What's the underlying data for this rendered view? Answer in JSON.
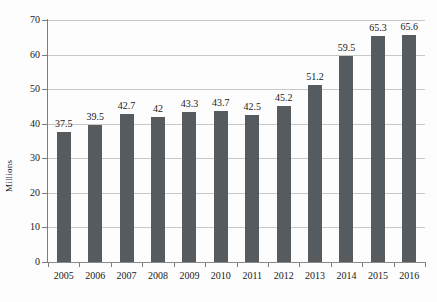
{
  "chart_data": {
    "type": "bar",
    "title": "",
    "subtitle": "",
    "xlabel": "",
    "ylabel": "Millions",
    "categories": [
      "2005",
      "2006",
      "2007",
      "2008",
      "2009",
      "2010",
      "2011",
      "2012",
      "2013",
      "2014",
      "2015",
      "2016"
    ],
    "values": [
      37.5,
      39.5,
      42.7,
      42,
      43.3,
      43.7,
      42.5,
      45.2,
      51.2,
      59.5,
      65.3,
      65.6
    ],
    "value_labels": [
      "37.5",
      "39.5",
      "42.7",
      "42",
      "43.3",
      "43.7",
      "42.5",
      "45.2",
      "51.2",
      "59.5",
      "65.3",
      "65.6"
    ],
    "ylim": [
      0,
      70
    ],
    "ytick_values": [
      0,
      10,
      20,
      30,
      40,
      50,
      60,
      70
    ],
    "ytick_labels": [
      "0",
      "10",
      "20",
      "30",
      "40",
      "50",
      "60",
      "70"
    ],
    "grid": true,
    "grid_axis": "y",
    "legend": null,
    "legend_position": "none",
    "bar_color": "#555B5E",
    "gridline_color": "#C8C8C8",
    "axis_color": "#7D7D7D",
    "background_color": "#FDFDFD",
    "text_color": "#1A1A1A",
    "data_labels_shown": true
  }
}
